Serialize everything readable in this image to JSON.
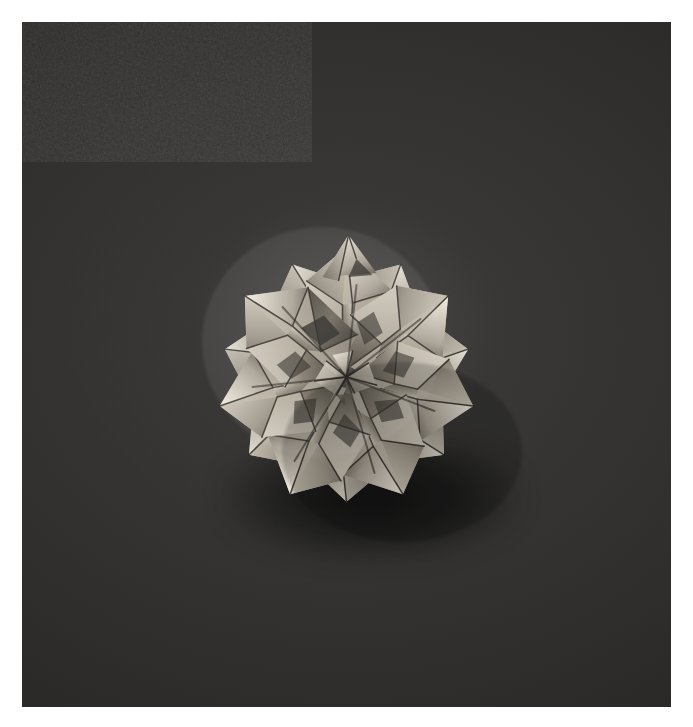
{
  "page": {
    "kind": "photograph",
    "width": 693,
    "height": 727,
    "paper_background": "#ffffff",
    "margins": {
      "left": 22,
      "top": 22,
      "right": 22,
      "bottom": 20
    }
  },
  "photo": {
    "subject": "modular origami star rosette (kusudama)",
    "backdrop_color": "#333231",
    "backdrop_color_light": "#4a4947",
    "backdrop_color_dark": "#232322",
    "paper_highlight": "#d9d3c6",
    "paper_midtone": "#a79f92",
    "paper_shadow": "#6e675d",
    "paper_deep_shadow": "#464038",
    "crease_line_color": "#2b2722",
    "shadow_color": "#0a0a0a",
    "grain": "film-grain",
    "plate": {
      "x": 22,
      "y": 22,
      "width": 649,
      "height": 685
    },
    "subject_bounds": {
      "x": 230,
      "y": 222,
      "width": 242,
      "height": 268
    },
    "subject_center": {
      "x": 351,
      "y": 355
    },
    "point_count": 7,
    "lighting": "top-left key light, soft",
    "no_text": true
  },
  "model": {
    "outer_points": [
      {
        "angle": -90,
        "radius": 130
      },
      {
        "angle": -39,
        "radius": 128
      },
      {
        "angle": 12,
        "radius": 126
      },
      {
        "angle": 63,
        "radius": 130
      },
      {
        "angle": 114,
        "radius": 132
      },
      {
        "angle": 165,
        "radius": 128
      },
      {
        "angle": 216,
        "radius": 126
      }
    ],
    "unit_count": 7,
    "unit_rotation_step": 51.43,
    "inner_radius": 62,
    "hub_radius": 16
  }
}
